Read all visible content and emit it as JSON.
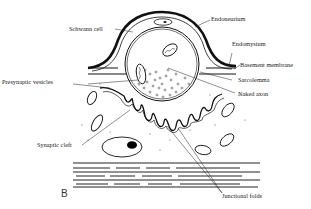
{
  "figure": {
    "panel_letter": "B",
    "labels": {
      "schwann_cell": "Schwann cell",
      "endoneurium": "Endoneurium",
      "endomysium": "Endomysium",
      "basement_membrane": "Basement membrane",
      "presynaptic_vesicles": "Presynaptic vesicles",
      "sarcolemma": "Sarcolemma",
      "naked_axon": "Naked axon",
      "synaptic_cleft": "Synaptic cleft",
      "junctional_folds": "Junctional folds"
    }
  }
}
